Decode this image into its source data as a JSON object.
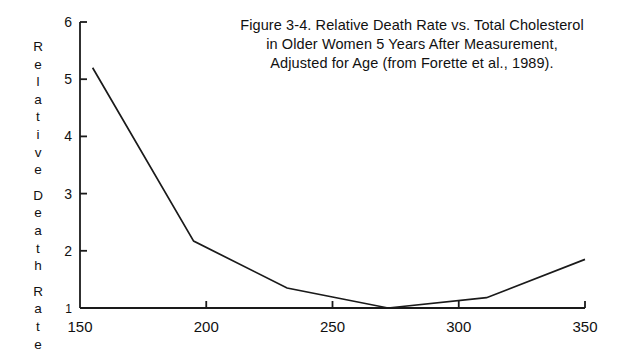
{
  "figure": {
    "title_lines": [
      "Figure 3-4. Relative Death Rate vs. Total Cholesterol",
      "in Older Women 5 Years After Measurement,",
      "Adjusted for Age (from Forette et al., 1989)."
    ],
    "y_axis_title_letters": [
      "R",
      "e",
      "l",
      "a",
      "t",
      "i",
      "v",
      "e",
      "",
      "D",
      "e",
      "a",
      "t",
      "h",
      "",
      "R",
      "a",
      "t",
      "e"
    ],
    "line_color": "#1a1a1a",
    "axis_color": "#1a1a1a",
    "background_color": "#ffffff"
  },
  "chart_data": {
    "type": "line",
    "title": "Figure 3-4. Relative Death Rate vs. Total Cholesterol in Older Women 5 Years After Measurement, Adjusted for Age (from Forette et al., 1989).",
    "xlabel": "Total Cholesterol",
    "ylabel": "Relative Death Rate",
    "xlim": [
      150,
      350
    ],
    "ylim": [
      1,
      6
    ],
    "xticks": [
      150,
      200,
      250,
      300,
      350
    ],
    "xtick_labels": [
      "150",
      "200",
      "250",
      "300",
      "350"
    ],
    "yticks": [
      1,
      2,
      3,
      4,
      5,
      6
    ],
    "ytick_labels": [
      "1",
      "2",
      "3",
      "4",
      "5",
      "6"
    ],
    "grid": false,
    "legend": false,
    "series": [
      {
        "name": "Relative Death Rate",
        "x": [
          155,
          195,
          232,
          272,
          311,
          350
        ],
        "values": [
          5.2,
          2.17,
          1.35,
          1.0,
          1.18,
          1.85
        ]
      }
    ]
  }
}
